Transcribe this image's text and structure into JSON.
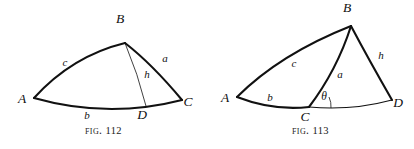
{
  "plate": {
    "background_color": "#ffffff",
    "ink_color": "#111111",
    "figures": [
      {
        "id": "fig-112",
        "caption_prefix": "Fig.",
        "caption_number": "112",
        "description": "Spherical triangle ABC with arc BD drawn as altitude h to side b at foot D",
        "vertices": [
          {
            "name": "A",
            "label": "A",
            "x": 34,
            "y": 98,
            "label_x": 22,
            "label_y": 103
          },
          {
            "name": "B",
            "label": "B",
            "x": 125,
            "y": 43,
            "label_x": 120,
            "label_y": 23
          },
          {
            "name": "C",
            "label": "C",
            "x": 182,
            "y": 100,
            "label_x": 188,
            "label_y": 106
          },
          {
            "name": "D",
            "label": "D",
            "x": 146,
            "y": 105,
            "label_x": 142,
            "label_y": 119
          }
        ],
        "sides": [
          {
            "name": "c",
            "label": "c",
            "from": "A",
            "to": "B",
            "label_x": 65,
            "label_y": 66
          },
          {
            "name": "a",
            "label": "a",
            "from": "B",
            "to": "C",
            "label_x": 165,
            "label_y": 62
          },
          {
            "name": "b",
            "label": "b",
            "from": "A",
            "to": "C",
            "label_x": 87,
            "label_y": 119
          },
          {
            "name": "h",
            "label": "h",
            "from": "B",
            "to": "D",
            "label_x": 147,
            "label_y": 78
          }
        ]
      },
      {
        "id": "fig-113",
        "caption_prefix": "Fig.",
        "caption_number": "113",
        "description": "Spherical triangle ABC with side b extended to D, altitude h from B to D and exterior angle theta at C",
        "vertices": [
          {
            "name": "A",
            "label": "A",
            "x": 30,
            "y": 97,
            "label_x": 18,
            "label_y": 102
          },
          {
            "name": "B",
            "label": "B",
            "x": 144,
            "y": 26,
            "label_x": 140,
            "label_y": 12
          },
          {
            "name": "C",
            "label": "C",
            "x": 102,
            "y": 107,
            "label_x": 98,
            "label_y": 121
          },
          {
            "name": "D",
            "label": "D",
            "x": 185,
            "y": 100,
            "label_x": 191,
            "label_y": 107
          }
        ],
        "sides": [
          {
            "name": "c",
            "label": "c",
            "from": "A",
            "to": "B",
            "label_x": 87,
            "label_y": 67
          },
          {
            "name": "a",
            "label": "a",
            "from": "C",
            "to": "B",
            "label_x": 133,
            "label_y": 78
          },
          {
            "name": "b",
            "label": "b",
            "from": "A",
            "to": "C",
            "label_x": 63,
            "label_y": 101
          },
          {
            "name": "h",
            "label": "h",
            "from": "B",
            "to": "D",
            "label_x": 174,
            "label_y": 59
          }
        ],
        "angles": [
          {
            "name": "theta",
            "label": "θ",
            "at_vertex": "C",
            "label_x": 117,
            "label_y": 100
          }
        ]
      }
    ]
  }
}
